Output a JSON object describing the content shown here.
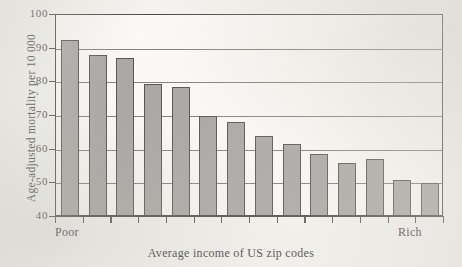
{
  "chart_data": {
    "type": "bar",
    "title": "",
    "xlabel": "Average income of US zip codes",
    "ylabel": "Age-adjusted mortality per 10 000",
    "ylim": [
      40,
      100
    ],
    "yticks": [
      40,
      50,
      60,
      70,
      80,
      90,
      100
    ],
    "ytick_labels": [
      "40",
      "50",
      "60",
      "70",
      "80",
      "90",
      "100"
    ],
    "grid": true,
    "grid_axis": "y",
    "legend": "none",
    "x_endpoint_low": "Poor",
    "x_endpoint_high": "Rich",
    "categories": [
      "1",
      "2",
      "3",
      "4",
      "5",
      "6",
      "7",
      "8",
      "9",
      "10",
      "11",
      "12",
      "13",
      "14"
    ],
    "values": [
      92,
      87.5,
      86.5,
      79,
      78,
      69.5,
      67.5,
      63.5,
      61,
      58,
      55.5,
      56.5,
      50.5,
      49.5
    ],
    "bar_color": "#9b9a97",
    "bar_edge_color": "#3a3834",
    "axis_color": "#2e2c28",
    "background_color": "#f3f2ee"
  },
  "y_axis": {
    "title": "Age-adjusted mortality per 10 000",
    "ticks": [
      "100",
      "90",
      "80",
      "70",
      "60",
      "50",
      "40"
    ]
  },
  "x_axis": {
    "title": "Average income of US zip codes",
    "left_label": "Poor",
    "right_label": "Rich"
  }
}
